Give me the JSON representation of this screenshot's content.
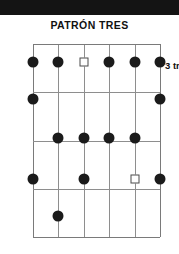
{
  "page": {
    "background_color": "#ffffff",
    "scan_band_color": "#141414"
  },
  "title": "PATRÓN TRES",
  "fret_label": "3 tr",
  "diagram": {
    "type": "guitar-scale-pattern",
    "string_count": 6,
    "fret_count": 5,
    "grid_color": "#8e8e8e",
    "dot_color": "#1b1b1b",
    "root_marker_color": "#4b4b4b",
    "string_x": [
      0,
      25.4,
      50.8,
      76.2,
      101.6,
      127
    ],
    "fret_y": [
      0,
      48.25,
      96.5,
      144.75,
      193
    ],
    "rows": [
      {
        "row": 1,
        "center_y": 18,
        "markers": [
          {
            "string": 1,
            "type": "dot"
          },
          {
            "string": 2,
            "type": "dot"
          },
          {
            "string": 3,
            "type": "square"
          },
          {
            "string": 4,
            "type": "dot"
          },
          {
            "string": 5,
            "type": "dot"
          },
          {
            "string": 6,
            "type": "dot"
          }
        ]
      },
      {
        "row": 2,
        "center_y": 55,
        "markers": [
          {
            "string": 1,
            "type": "dot"
          },
          {
            "string": 6,
            "type": "dot"
          }
        ]
      },
      {
        "row": 3,
        "center_y": 94,
        "markers": [
          {
            "string": 2,
            "type": "dot"
          },
          {
            "string": 3,
            "type": "dot"
          },
          {
            "string": 4,
            "type": "dot"
          },
          {
            "string": 5,
            "type": "dot"
          }
        ]
      },
      {
        "row": 4,
        "center_y": 135,
        "markers": [
          {
            "string": 1,
            "type": "dot"
          },
          {
            "string": 3,
            "type": "dot"
          },
          {
            "string": 5,
            "type": "square"
          },
          {
            "string": 6,
            "type": "dot"
          }
        ]
      },
      {
        "row": 5,
        "center_y": 172,
        "markers": [
          {
            "string": 2,
            "type": "dot"
          }
        ]
      }
    ]
  }
}
